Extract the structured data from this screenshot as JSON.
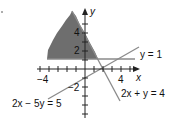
{
  "figure": {
    "type": "system-of-linear-inequalities-graph",
    "axes": {
      "x_label": "x",
      "y_label": "y",
      "x_tick_label": "4",
      "x_neg_tick_label": "−4",
      "y_tick_labels": [
        "4",
        "2",
        "−2"
      ],
      "x_range": [
        -5,
        6
      ],
      "y_range": [
        -6,
        7
      ]
    },
    "lines": [
      {
        "id": "line-y1",
        "label": "y = 1",
        "equation": "y = 1"
      },
      {
        "id": "line-2x-plus-y",
        "label": "2x + y = 4",
        "equation": "2x + y = 4"
      },
      {
        "id": "line-2x-minus-5y",
        "label": "2x − 5y = 5",
        "equation": "2x − 5y = 5"
      }
    ],
    "shaded_region": {
      "description": "Region above y = 1 and left of 2x + y = 4",
      "fill_color": "#6e6e6e"
    },
    "colors": {
      "axis": "#222222",
      "line": "#8a8a8a",
      "shade": "#6e6e6e"
    }
  }
}
